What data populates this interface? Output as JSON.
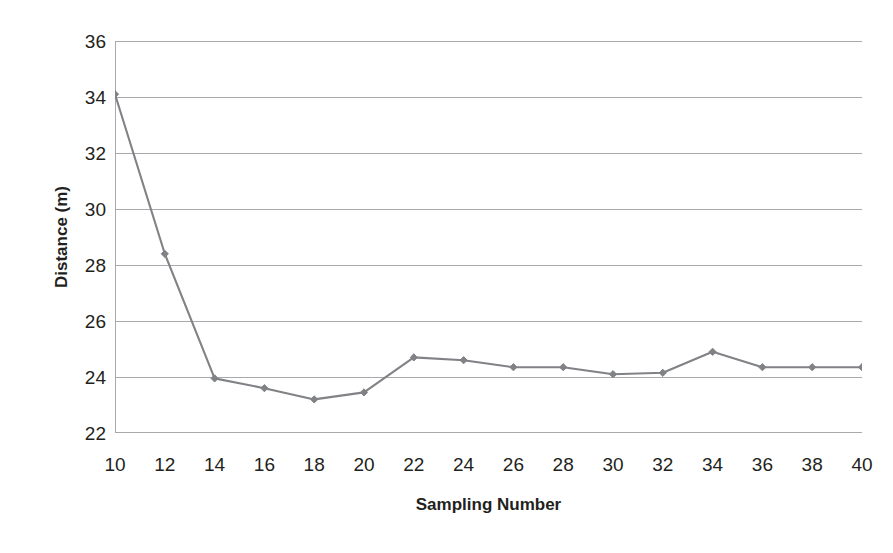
{
  "chart_data": {
    "type": "line",
    "title": "",
    "xlabel": "Sampling Number",
    "ylabel": "Distance (m)",
    "x": [
      10,
      12,
      14,
      16,
      18,
      20,
      22,
      24,
      26,
      28,
      30,
      32,
      34,
      36,
      38,
      40
    ],
    "values": [
      34.1,
      28.4,
      23.95,
      23.6,
      23.2,
      23.45,
      24.7,
      24.6,
      24.35,
      24.35,
      24.1,
      24.15,
      24.9,
      24.35,
      24.35,
      24.35
    ],
    "series": [
      {
        "name": "Distance",
        "values": [
          34.1,
          28.4,
          23.95,
          23.6,
          23.2,
          23.45,
          24.7,
          24.6,
          24.35,
          24.35,
          24.1,
          24.15,
          24.9,
          24.35,
          24.35,
          24.35
        ]
      }
    ],
    "xlim": [
      10,
      40
    ],
    "ylim": [
      22,
      36
    ],
    "xticks": [
      10,
      12,
      14,
      16,
      18,
      20,
      22,
      24,
      26,
      28,
      30,
      32,
      34,
      36,
      38,
      40
    ],
    "yticks": [
      22,
      24,
      26,
      28,
      30,
      32,
      34,
      36
    ],
    "xtick_labels": [
      "10",
      "12",
      "14",
      "16",
      "18",
      "20",
      "22",
      "24",
      "26",
      "28",
      "30",
      "32",
      "34",
      "36",
      "38",
      "40"
    ],
    "ytick_labels": [
      "22",
      "24",
      "26",
      "28",
      "30",
      "32",
      "34",
      "36"
    ],
    "grid": "horizontal",
    "legend": "none",
    "marker": "diamond",
    "colors": {
      "line": "#808285",
      "marker": "#808285",
      "gridline": "#a7a9ac",
      "axis": "#a7a9ac",
      "text": "#231f20",
      "background": "#ffffff"
    }
  }
}
